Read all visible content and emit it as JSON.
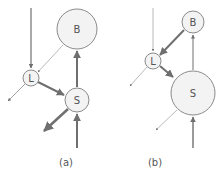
{
  "figure": {
    "panels": [
      {
        "id": "a",
        "caption": "(a)",
        "caption_pos": [
          66,
          166
        ],
        "nodes": [
          {
            "id": "B",
            "label": "B",
            "cx": 77,
            "cy": 29,
            "r": 20
          },
          {
            "id": "L",
            "label": "L",
            "cx": 31,
            "cy": 78,
            "r": 8
          },
          {
            "id": "S",
            "label": "S",
            "cx": 77,
            "cy": 100,
            "r": 12
          }
        ],
        "edges": [
          {
            "from": "input-top",
            "to": "L",
            "x1": 31,
            "y1": 8,
            "x2": 31,
            "y2": 68,
            "width": 1.2,
            "strength": "medium"
          },
          {
            "from": "B",
            "to": "L",
            "x1": 63,
            "y1": 45,
            "x2": 38,
            "y2": 72,
            "width": 0.6,
            "strength": "weak"
          },
          {
            "from": "L",
            "to": "S",
            "x1": 38,
            "y1": 82,
            "x2": 64,
            "y2": 95,
            "width": 2,
            "strength": "strong"
          },
          {
            "from": "S",
            "to": "B",
            "x1": 77,
            "y1": 87,
            "x2": 77,
            "y2": 51,
            "width": 2,
            "strength": "strong"
          },
          {
            "from": "L",
            "to": "output-left",
            "x1": 25,
            "y1": 84,
            "x2": 8,
            "y2": 101,
            "width": 0.8,
            "strength": "weak"
          },
          {
            "from": "S",
            "to": "output-bottom-left",
            "x1": 68,
            "y1": 109,
            "x2": 44,
            "y2": 131,
            "width": 2.5,
            "strength": "strong"
          },
          {
            "from": "input-bottom",
            "to": "S",
            "x1": 77,
            "y1": 148,
            "x2": 77,
            "y2": 114,
            "width": 2,
            "strength": "strong"
          }
        ]
      },
      {
        "id": "b",
        "caption": "(b)",
        "caption_pos": [
          155,
          166
        ],
        "nodes": [
          {
            "id": "B",
            "label": "B",
            "cx": 193,
            "cy": 22,
            "r": 11
          },
          {
            "id": "L",
            "label": "L",
            "cx": 153,
            "cy": 61,
            "r": 8
          },
          {
            "id": "S",
            "label": "S",
            "cx": 193,
            "cy": 93,
            "r": 22
          }
        ],
        "edges": [
          {
            "from": "input-top",
            "to": "L",
            "x1": 153,
            "y1": 8,
            "x2": 153,
            "y2": 51,
            "width": 0.6,
            "strength": "weak"
          },
          {
            "from": "B",
            "to": "L",
            "x1": 184,
            "y1": 30,
            "x2": 160,
            "y2": 55,
            "width": 2,
            "strength": "strong"
          },
          {
            "from": "L",
            "to": "S",
            "x1": 160,
            "y1": 66,
            "x2": 173,
            "y2": 77,
            "width": 2,
            "strength": "strong"
          },
          {
            "from": "S",
            "to": "B",
            "x1": 193,
            "y1": 70,
            "x2": 193,
            "y2": 35,
            "width": 1,
            "strength": "medium"
          },
          {
            "from": "L",
            "to": "output-left",
            "x1": 147,
            "y1": 67,
            "x2": 130,
            "y2": 86,
            "width": 0.6,
            "strength": "weak"
          },
          {
            "from": "S",
            "to": "output-bottom-left",
            "x1": 177,
            "y1": 110,
            "x2": 156,
            "y2": 130,
            "width": 0.6,
            "strength": "weak"
          },
          {
            "from": "input-bottom",
            "to": "S",
            "x1": 193,
            "y1": 148,
            "x2": 193,
            "y2": 117,
            "width": 1.4,
            "strength": "medium"
          }
        ]
      }
    ],
    "colors": {
      "edge": "#6f6f6f",
      "edge_weak": "#8c8c8c",
      "node_fill": "#f3f3f3",
      "node_stroke": "#8a8a8a",
      "text": "#555555"
    }
  }
}
